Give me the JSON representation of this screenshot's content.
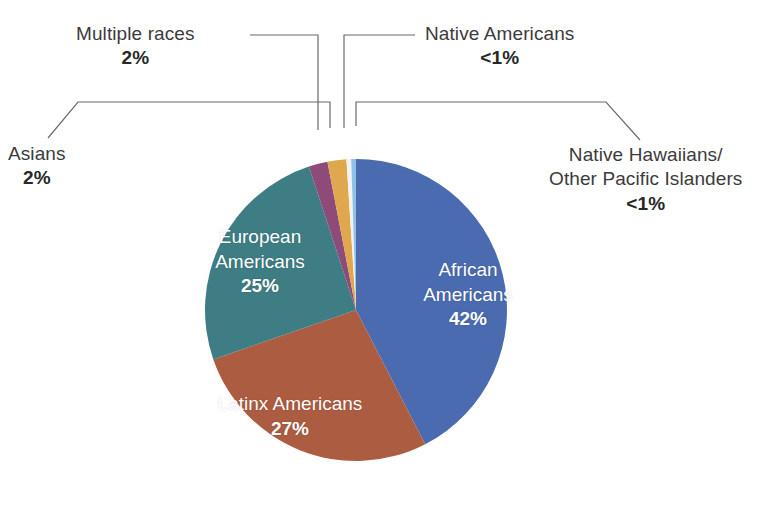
{
  "chart_data": {
    "type": "pie",
    "title": "",
    "subtitle": "",
    "xlabel": "",
    "ylabel": "",
    "legend_position": "callout-labels",
    "grid": false,
    "categories": [
      "African Americans",
      "Latinx Americans",
      "European Americans",
      "Multiple races",
      "Asians",
      "Native Americans",
      "Native Hawaiians/Other Pacific Islanders"
    ],
    "values": [
      42,
      27,
      25,
      2,
      2,
      0.5,
      0.5
    ],
    "value_labels": [
      "42%",
      "27%",
      "25%",
      "2%",
      "2%",
      "<1%",
      "<1%"
    ],
    "colors": [
      "#4b6bb0",
      "#ab5c41",
      "#3e7d84",
      "#8e4a78",
      "#e0a84e",
      "#f2f2f2",
      "#8fc0e8"
    ],
    "slices": [
      {
        "name": "African Americans",
        "value": 42,
        "label": "42%",
        "color": "#4b6bb0",
        "label_placement": "inside"
      },
      {
        "name": "Latinx Americans",
        "value": 27,
        "label": "27%",
        "color": "#ab5c41",
        "label_placement": "inside"
      },
      {
        "name": "European Americans",
        "value": 25,
        "label": "25%",
        "color": "#3e7d84",
        "label_placement": "inside"
      },
      {
        "name": "Multiple races",
        "value": 2,
        "label": "2%",
        "color": "#8e4a78",
        "label_placement": "callout"
      },
      {
        "name": "Asians",
        "value": 2,
        "label": "2%",
        "color": "#e0a84e",
        "label_placement": "callout"
      },
      {
        "name": "Native Americans",
        "value": 0.5,
        "label": "<1%",
        "color": "#f2f2f2",
        "label_placement": "callout"
      },
      {
        "name": "Native Hawaiians/Other Pacific Islanders",
        "value": 0.5,
        "label": "<1%",
        "color": "#8fc0e8",
        "label_placement": "callout"
      }
    ]
  },
  "labels": {
    "multiple_races": {
      "name": "Multiple races",
      "pct": "2%"
    },
    "asians": {
      "name": "Asians",
      "pct": "2%"
    },
    "native_americans": {
      "name": "Native Americans",
      "pct": "<1%"
    },
    "native_hawaiians": {
      "name_line1": "Native Hawaiians/",
      "name_line2": "Other Pacific Islanders",
      "pct": "<1%"
    },
    "african_americans": {
      "name_line1": "African",
      "name_line2": "Americans",
      "pct": "42%"
    },
    "european_americans": {
      "name_line1": "European",
      "name_line2": "Americans",
      "pct": "25%"
    },
    "latinx_americans": {
      "name_line1": "Latinx Americans",
      "pct": "27%"
    }
  },
  "colors": {
    "african_americans": "#4b6bb0",
    "latinx_americans": "#ab5c41",
    "european_americans": "#3e7d84",
    "multiple_races": "#8e4a78",
    "asians": "#e0a84e",
    "native_americans": "#f2f2f2",
    "native_hawaiians": "#8fc0e8",
    "background": "#ffffff",
    "text": "#3b3b3b",
    "leader_line": "#6b6b6b"
  }
}
